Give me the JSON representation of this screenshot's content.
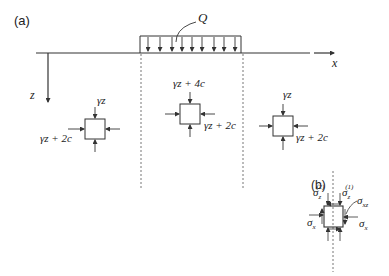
{
  "panel_a": {
    "label": "(a)",
    "load_label": "Q",
    "x_axis_label": "x",
    "z_axis_label": "z",
    "elements": [
      {
        "name": "left",
        "top_stress": "γz",
        "side_stress": "γz + 2c"
      },
      {
        "name": "middle",
        "top_stress": "γz + 4c",
        "side_stress": "γz + 2c"
      },
      {
        "name": "right",
        "top_stress": "γz",
        "side_stress": "γz + 2c"
      }
    ]
  },
  "panel_b": {
    "label": "(b)",
    "sigma_z2": "σ",
    "sigma_z2_sub": "z",
    "sigma_z2_sup": "(2)",
    "sigma_z1": "σ",
    "sigma_z1_sub": "z",
    "sigma_z1_sup": "(1)",
    "sigma_xz": "σ",
    "sigma_xz_sub": "xz",
    "sigma_x_left": "σ",
    "sigma_x_left_sub": "x",
    "sigma_x_right": "σ",
    "sigma_x_right_sub": "x"
  },
  "colors": {
    "line": "#333333",
    "dash": "#666666"
  }
}
